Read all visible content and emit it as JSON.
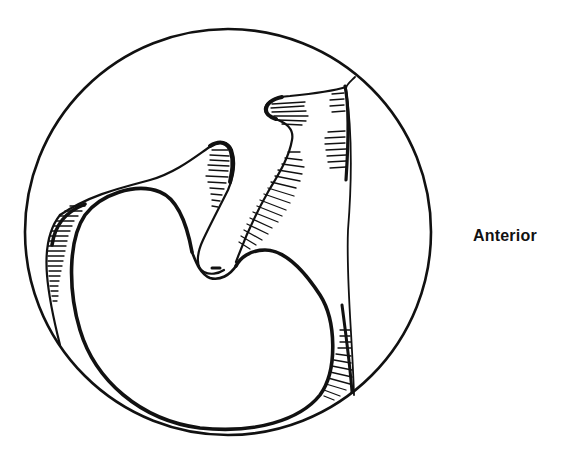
{
  "figure": {
    "type": "anatomical line illustration",
    "frame": "circle",
    "ink_color": "#111111",
    "background_color": "#ffffff"
  },
  "labels": {
    "orientation": "Anterior"
  }
}
